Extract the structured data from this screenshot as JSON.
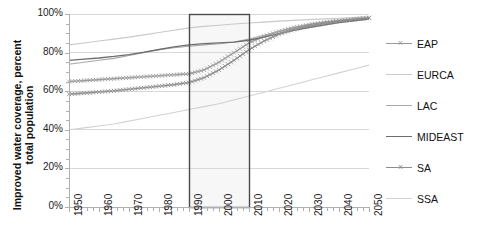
{
  "chart_data": {
    "type": "line",
    "title": "",
    "xlabel": "",
    "ylabel": "Improved water coverage, percent\ntotal population",
    "xlim": [
      1950,
      2050
    ],
    "ylim": [
      0,
      100
    ],
    "grid": true,
    "legend_position": "right",
    "x_tick_labels": [
      "1950",
      "1960",
      "1970",
      "1980",
      "1990",
      "2000",
      "2010",
      "2020",
      "2030",
      "2040",
      "2050"
    ],
    "y_tick_labels": [
      "0%",
      "20%",
      "40%",
      "60%",
      "80%",
      "100%"
    ],
    "y_tick_values": [
      0,
      20,
      40,
      60,
      80,
      100
    ],
    "x": [
      1950,
      1955,
      1960,
      1965,
      1970,
      1975,
      1980,
      1985,
      1990,
      1995,
      2000,
      2005,
      2010,
      2015,
      2020,
      2025,
      2030,
      2035,
      2040,
      2045,
      2050
    ],
    "series": [
      {
        "name": "EAP",
        "color": "#9a9a9a",
        "marker": "x",
        "values": [
          65,
          65.5,
          66,
          66.5,
          67,
          67.5,
          68,
          68.5,
          69,
          71,
          75,
          80,
          85,
          88.5,
          91,
          93,
          94.5,
          95.7,
          96.6,
          97.4,
          98.1
        ]
      },
      {
        "name": "EURCA",
        "color": "#c9c9c9",
        "marker": "none",
        "values": [
          84,
          85,
          86,
          87,
          88,
          89.2,
          90.4,
          91.6,
          92.8,
          93.6,
          94.2,
          94.8,
          95.3,
          95.8,
          96.3,
          96.7,
          97.1,
          97.5,
          97.8,
          98.1,
          98.4
        ]
      },
      {
        "name": "LAC",
        "color": "#a8a8a8",
        "marker": "none",
        "values": [
          74,
          75,
          76,
          77,
          78.5,
          80,
          81.5,
          82.5,
          83.3,
          84,
          84.6,
          85.5,
          87,
          89,
          90.8,
          92.4,
          93.8,
          95,
          96,
          96.9,
          97.7
        ]
      },
      {
        "name": "MIDEAST",
        "color": "#6e6e6e",
        "marker": "none",
        "values": [
          76,
          76.6,
          77.2,
          78,
          79,
          80.2,
          81.6,
          83,
          84,
          84.6,
          85,
          85.4,
          86.4,
          88,
          89.8,
          91.5,
          93,
          94.3,
          95.5,
          96.5,
          97.4
        ]
      },
      {
        "name": "SA",
        "color": "#8d8d8d",
        "marker": "x",
        "values": [
          58.5,
          59,
          59.6,
          60.2,
          61,
          61.8,
          62.6,
          63.4,
          64.5,
          67,
          71,
          76,
          81.5,
          86,
          89.5,
          92,
          93.8,
          95.2,
          96.3,
          97.2,
          98
        ]
      },
      {
        "name": "SSA",
        "color": "#d2d2d2",
        "marker": "none",
        "values": [
          40,
          41,
          42,
          43,
          44.5,
          46,
          47.5,
          49,
          50.5,
          52,
          53.5,
          55.5,
          57.5,
          59.5,
          61.5,
          63.5,
          65.5,
          67.5,
          69.5,
          71.5,
          73.5
        ]
      }
    ],
    "highlight_box": {
      "x_start": 1990,
      "x_end": 2010,
      "y_start": 0,
      "y_end": 100,
      "border_color": "#4a4a4a",
      "fill_color": "#f7f7f7"
    },
    "axis_color": "#b0b0b0",
    "grid_color": "#d8d8d8"
  },
  "legend": {
    "items": [
      {
        "label": "EAP"
      },
      {
        "label": "EURCA"
      },
      {
        "label": "LAC"
      },
      {
        "label": "MIDEAST"
      },
      {
        "label": "SA"
      },
      {
        "label": "SSA"
      }
    ]
  }
}
